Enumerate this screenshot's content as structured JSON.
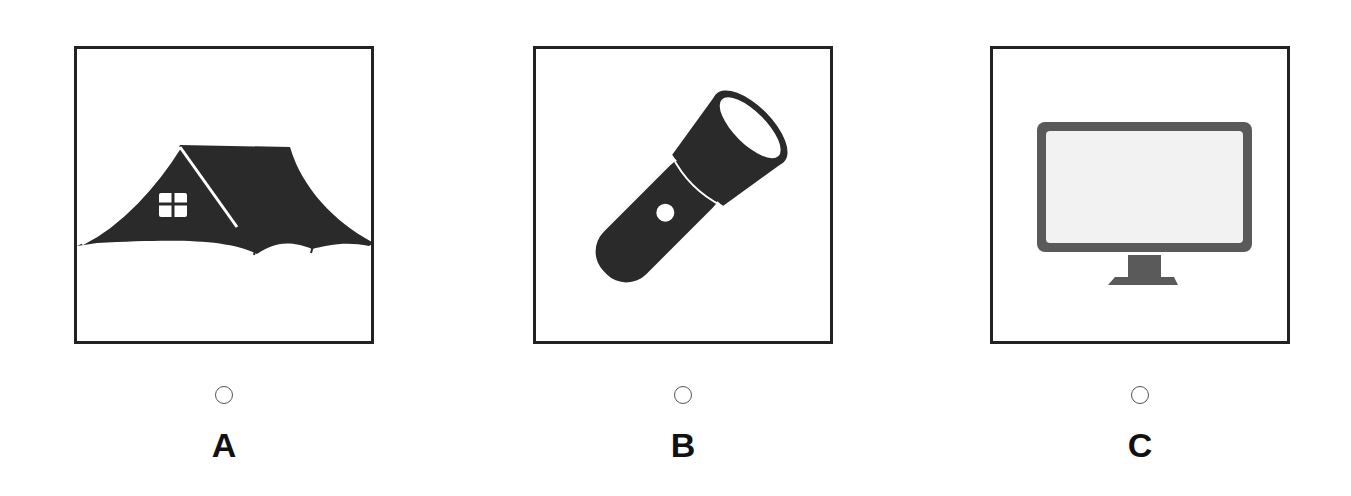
{
  "options": [
    {
      "id": "A",
      "label": "A",
      "icon": "tent-icon",
      "selected": false
    },
    {
      "id": "B",
      "label": "B",
      "icon": "flashlight-icon",
      "selected": false
    },
    {
      "id": "C",
      "label": "C",
      "icon": "monitor-icon",
      "selected": false
    }
  ],
  "colors": {
    "icon_dark": "#2a2a2a",
    "monitor_gray": "#5a5a5a",
    "border": "#222222"
  }
}
